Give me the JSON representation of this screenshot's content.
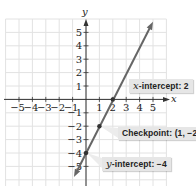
{
  "chart_data": {
    "type": "line",
    "title": "",
    "xlabel": "x",
    "ylabel": "y",
    "xlim": [
      -6,
      6
    ],
    "ylim": [
      -6,
      6
    ],
    "grid": true,
    "x_ticks": [
      -5,
      -4,
      -3,
      -2,
      -1,
      1,
      2,
      3,
      4,
      5
    ],
    "y_ticks": [
      5,
      4,
      3,
      2,
      1,
      -1,
      -2,
      -3,
      -4,
      -5
    ],
    "x_tick_labels": [
      "−5",
      "−4",
      "−3",
      "−2",
      "−1",
      "1",
      "2",
      "3",
      "4",
      "5"
    ],
    "y_tick_labels": [
      "5",
      "4",
      "3",
      "2",
      "1",
      "−1",
      "−2",
      "−3",
      "−4",
      "−5"
    ],
    "series": [
      {
        "name": "line y = 2x − 4",
        "slope": 2,
        "intercept": -4,
        "x": [
          -0.9,
          5
        ],
        "y": [
          -5.8,
          5.8
        ],
        "color": "#666666"
      }
    ],
    "points": [
      {
        "name": "y-intercept",
        "x": 0,
        "y": -4
      },
      {
        "name": "checkpoint",
        "x": 1,
        "y": -2
      },
      {
        "name": "x-intercept",
        "x": 2,
        "y": 0
      }
    ],
    "annotations": [
      {
        "prefix": "x",
        "text": "-intercept: 2",
        "point": "x-intercept"
      },
      {
        "prefix": "",
        "text": "Checkpoint: (1, −2)",
        "point": "checkpoint"
      },
      {
        "prefix": "y",
        "text": "-intercept: −4",
        "point": "y-intercept"
      }
    ]
  },
  "labels": {
    "x_intercept_var": "x",
    "x_intercept_text": "-intercept: 2",
    "checkpoint_text": "Checkpoint: (1, −2)",
    "y_intercept_var": "y",
    "y_intercept_text": "-intercept: −4"
  },
  "colors": {
    "grid": "#e2e2e2",
    "axis": "#333333",
    "line": "#666666",
    "label_bg": "#e6e6e6"
  }
}
